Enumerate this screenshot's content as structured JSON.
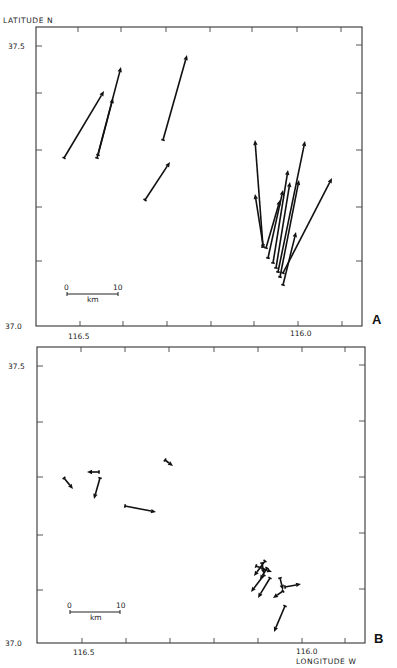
{
  "chart_data": [
    {
      "type": "scatter",
      "subtype": "vector-field",
      "panel": "A",
      "title": "",
      "ylabel": "LATITUDE N",
      "xlabel": "",
      "xlim": [
        116.6,
        115.85
      ],
      "ylim": [
        37.0,
        37.6
      ],
      "x_ticks": [
        116.5,
        116.0
      ],
      "y_ticks": [
        37.0,
        37.5
      ],
      "x_tick_labels": [
        "116.5",
        "116.0"
      ],
      "y_tick_labels": [
        "37.0",
        "37.5"
      ],
      "grid": false,
      "scale_bar": {
        "min_label": "0",
        "max_label": "10",
        "unit": "km"
      },
      "vectors_px": [
        {
          "tail": [
            64,
            158
          ],
          "head": [
            104,
            91
          ]
        },
        {
          "tail": [
            97,
            158
          ],
          "head": [
            121,
            67
          ]
        },
        {
          "tail": [
            98,
            155
          ],
          "head": [
            113,
            98
          ]
        },
        {
          "tail": [
            163,
            140
          ],
          "head": [
            187,
            55
          ]
        },
        {
          "tail": [
            145,
            200
          ],
          "head": [
            170,
            162
          ]
        },
        {
          "tail": [
            263,
            247
          ],
          "head": [
            255,
            140
          ]
        },
        {
          "tail": [
            263,
            245
          ],
          "head": [
            255,
            194
          ]
        },
        {
          "tail": [
            266,
            248
          ],
          "head": [
            280,
            200
          ]
        },
        {
          "tail": [
            268,
            258
          ],
          "head": [
            283,
            190
          ]
        },
        {
          "tail": [
            273,
            263
          ],
          "head": [
            288,
            170
          ]
        },
        {
          "tail": [
            276,
            268
          ],
          "head": [
            290,
            182
          ]
        },
        {
          "tail": [
            278,
            272
          ],
          "head": [
            305,
            141
          ]
        },
        {
          "tail": [
            280,
            277
          ],
          "head": [
            299,
            180
          ]
        },
        {
          "tail": [
            283,
            285
          ],
          "head": [
            296,
            232
          ]
        },
        {
          "tail": [
            283,
            273
          ],
          "head": [
            332,
            178
          ]
        }
      ]
    },
    {
      "type": "scatter",
      "subtype": "vector-field",
      "panel": "B",
      "title": "",
      "ylabel": "",
      "xlabel": "LONGITUDE W",
      "xlim": [
        116.6,
        115.85
      ],
      "ylim": [
        37.0,
        37.6
      ],
      "x_ticks": [
        116.5,
        116.0
      ],
      "y_ticks": [
        37.0,
        37.5
      ],
      "x_tick_labels": [
        "116.5",
        "116.0"
      ],
      "y_tick_labels": [
        "37.0",
        "37.5"
      ],
      "grid": false,
      "scale_bar": {
        "min_label": "0",
        "max_label": "10",
        "unit": "km"
      },
      "vectors_px": [
        {
          "tail": [
            64,
            478
          ],
          "head": [
            73,
            489
          ]
        },
        {
          "tail": [
            99,
            472
          ],
          "head": [
            87,
            472
          ]
        },
        {
          "tail": [
            100,
            478
          ],
          "head": [
            94,
            499
          ]
        },
        {
          "tail": [
            125,
            506
          ],
          "head": [
            156,
            512
          ]
        },
        {
          "tail": [
            165,
            460
          ],
          "head": [
            173,
            466
          ]
        },
        {
          "tail": [
            265,
            561
          ],
          "head": [
            254,
            576
          ]
        },
        {
          "tail": [
            256,
            566
          ],
          "head": [
            272,
            572
          ]
        },
        {
          "tail": [
            262,
            563
          ],
          "head": [
            264,
            574
          ]
        },
        {
          "tail": [
            267,
            568
          ],
          "head": [
            260,
            580
          ]
        },
        {
          "tail": [
            264,
            575
          ],
          "head": [
            251,
            592
          ]
        },
        {
          "tail": [
            270,
            578
          ],
          "head": [
            258,
            598
          ]
        },
        {
          "tail": [
            285,
            587
          ],
          "head": [
            301,
            584
          ]
        },
        {
          "tail": [
            280,
            578
          ],
          "head": [
            283,
            590
          ]
        },
        {
          "tail": [
            283,
            591
          ],
          "head": [
            273,
            598
          ]
        },
        {
          "tail": [
            285,
            606
          ],
          "head": [
            274,
            632
          ]
        }
      ]
    }
  ],
  "panels": [
    {
      "letter": "A",
      "frame": {
        "x": 36,
        "y": 27,
        "w": 326,
        "h": 299
      },
      "y_label": "LATITUDE N",
      "x_label": "",
      "y_tick_label_top": "37.5",
      "y_tick_label_bottom": "37.0",
      "x_tick_label_left": "116.5",
      "x_tick_label_right": "116.0",
      "top_ticks_x": [
        78,
        121,
        166,
        210,
        252,
        297,
        341
      ],
      "bottom_ticks_x": [
        80,
        123,
        167,
        211,
        254,
        298,
        342
      ],
      "left_ticks_y": [
        46,
        93,
        150,
        207,
        261
      ],
      "right_ticks_y": [
        45,
        93,
        150,
        207,
        261
      ],
      "scale": {
        "x0": 67,
        "x1": 118,
        "y": 294,
        "label0": "0",
        "label10": "10",
        "unit": "km"
      }
    },
    {
      "letter": "B",
      "frame": {
        "x": 37,
        "y": 347,
        "w": 328,
        "h": 296
      },
      "y_label": "",
      "x_label": "LONGITUDE W",
      "y_tick_label_top": "37.5",
      "y_tick_label_bottom": "37.0",
      "x_tick_label_left": "116.5",
      "x_tick_label_right": "116.0",
      "top_ticks_x": [
        81,
        125,
        169,
        214,
        258,
        302,
        345
      ],
      "bottom_ticks_x": [
        82,
        126,
        170,
        214,
        258,
        302,
        345
      ],
      "left_ticks_y": [
        366,
        422,
        477,
        535,
        590
      ],
      "right_ticks_y": [
        365,
        421,
        477,
        533,
        589
      ],
      "scale": {
        "x0": 70,
        "x1": 120,
        "y": 612,
        "label0": "0",
        "label10": "10",
        "unit": "km"
      }
    }
  ],
  "labels": {
    "y_axis_title": "LATITUDE N",
    "x_axis_title": "LONGITUDE W",
    "panel_a": "A",
    "panel_b": "B",
    "lat_375": "37.5",
    "lat_370": "37.0",
    "lon_1165": "116.5",
    "lon_1160": "116.0",
    "scale_zero": "0",
    "scale_ten": "10",
    "scale_unit": "km"
  },
  "colors": {
    "ink": "#111111",
    "frame": "#333333",
    "background": "#ffffff"
  }
}
